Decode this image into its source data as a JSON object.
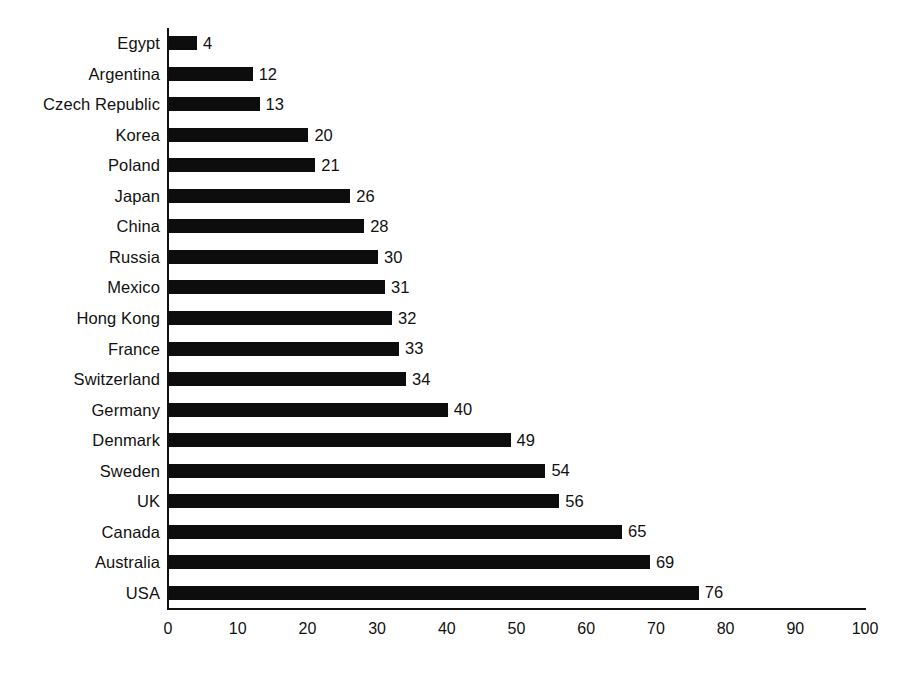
{
  "chart_data": {
    "type": "bar",
    "orientation": "horizontal",
    "title": "",
    "subtitle": "",
    "xlabel": "",
    "ylabel": "",
    "xlim": [
      0,
      100
    ],
    "ylim": null,
    "grid": false,
    "legend": null,
    "bar_color": "#0d0d0d",
    "background_color": "#ffffff",
    "axis_color": "#111111",
    "xticks": [
      0,
      10,
      20,
      30,
      40,
      50,
      60,
      70,
      80,
      90,
      100
    ],
    "xtick_labels": [
      "0",
      "10",
      "20",
      "30",
      "40",
      "50",
      "60",
      "70",
      "80",
      "90",
      "100"
    ],
    "categories": [
      "Egypt",
      "Argentina",
      "Czech Republic",
      "Korea",
      "Poland",
      "Japan",
      "China",
      "Russia",
      "Mexico",
      "Hong Kong",
      "France",
      "Switzerland",
      "Germany",
      "Denmark",
      "Sweden",
      "UK",
      "Canada",
      "Australia",
      "USA"
    ],
    "values": [
      4,
      12,
      13,
      20,
      21,
      26,
      28,
      30,
      31,
      32,
      33,
      34,
      40,
      49,
      54,
      56,
      65,
      69,
      76
    ],
    "value_labels": [
      "4",
      "12",
      "13",
      "20",
      "21",
      "26",
      "28",
      "30",
      "31",
      "32",
      "33",
      "34",
      "40",
      "49",
      "54",
      "56",
      "65",
      "69",
      "76"
    ]
  }
}
